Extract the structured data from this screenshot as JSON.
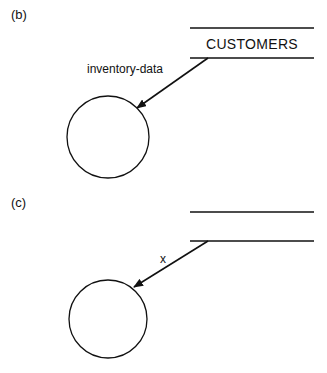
{
  "panels": [
    {
      "label": "(b)",
      "data_store": {
        "name": "CUSTOMERS"
      },
      "flow": {
        "label": "inventory-data",
        "direction": "store-to-process"
      },
      "process": {
        "label": ""
      }
    },
    {
      "label": "(c)",
      "data_store": {
        "name": ""
      },
      "flow": {
        "label": "x",
        "direction": "store-to-process"
      },
      "process": {
        "label": ""
      }
    }
  ],
  "colors": {
    "line": "#111111",
    "background": "#ffffff"
  }
}
